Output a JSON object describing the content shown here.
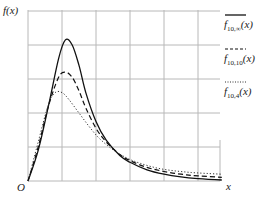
{
  "chart_data": {
    "type": "line",
    "title": "",
    "xlabel": "x",
    "ylabel": "f(x)",
    "origin_label": "O",
    "grid": true,
    "xlim": [
      0,
      5.7
    ],
    "ylim": [
      0,
      5
    ],
    "x_ticks": [],
    "y_ticks": [],
    "legend_position": "right",
    "series": [
      {
        "name": "f_{10,∞}(x)",
        "base": "f",
        "subscript": "10,∞",
        "arg": "(x)",
        "style": "solid",
        "color": "#111111",
        "x": [
          0,
          0.3,
          0.6,
          0.9,
          1.1,
          1.3,
          1.5,
          1.7,
          2.0,
          2.3,
          2.7,
          3.0,
          3.5,
          4.0,
          4.5,
          5.0,
          5.7
        ],
        "y": [
          0,
          0.9,
          2.2,
          3.6,
          4.15,
          4.0,
          3.4,
          2.6,
          1.75,
          1.2,
          0.75,
          0.55,
          0.33,
          0.2,
          0.12,
          0.07,
          0.03
        ]
      },
      {
        "name": "f_{10,10}(x)",
        "base": "f",
        "subscript": "10,10",
        "arg": "(x)",
        "style": "dashed",
        "color": "#111111",
        "x": [
          0,
          0.3,
          0.6,
          0.9,
          1.1,
          1.3,
          1.5,
          1.7,
          2.0,
          2.3,
          2.7,
          3.0,
          3.5,
          4.0,
          4.5,
          5.0,
          5.7
        ],
        "y": [
          0,
          1.0,
          2.2,
          3.05,
          3.2,
          3.05,
          2.65,
          2.15,
          1.55,
          1.15,
          0.78,
          0.6,
          0.4,
          0.28,
          0.2,
          0.15,
          0.11
        ]
      },
      {
        "name": "f_{10,4}(x)",
        "base": "f",
        "subscript": "10,4",
        "arg": "(x)",
        "style": "dotted",
        "color": "#333333",
        "x": [
          0,
          0.3,
          0.6,
          0.8,
          1.0,
          1.2,
          1.5,
          1.8,
          2.1,
          2.5,
          2.9,
          3.3,
          3.8,
          4.3,
          4.8,
          5.3,
          5.7
        ],
        "y": [
          0,
          1.15,
          2.25,
          2.6,
          2.6,
          2.4,
          2.0,
          1.6,
          1.25,
          0.92,
          0.68,
          0.52,
          0.38,
          0.3,
          0.25,
          0.22,
          0.2
        ]
      }
    ]
  },
  "layout": {
    "plot_left": 28,
    "plot_bottom": 181,
    "unit_px": 34,
    "plot_right": 220,
    "plot_top": 10,
    "grid_x": [
      0,
      1,
      2,
      3,
      4,
      5
    ],
    "grid_y": [
      0,
      1,
      2,
      3,
      4,
      5
    ]
  }
}
